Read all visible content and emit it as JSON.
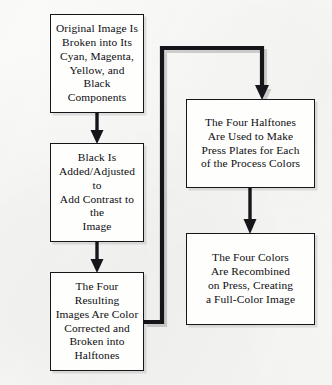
{
  "diagram": {
    "background_color": "#fdfdfc",
    "line_color": "#16161a",
    "text_color": "#0d0d10",
    "nodes": [
      {
        "id": "split",
        "label": "Original Image Is\nBroken into Its\nCyan, Magenta,\nYellow, and Black\nComponents",
        "column": "left",
        "order": 1
      },
      {
        "id": "black",
        "label": "Black Is\nAdded/Adjusted to\nAdd Contrast to the\nImage",
        "column": "left",
        "order": 2
      },
      {
        "id": "halftones",
        "label": "The Four Resulting\nImages Are Color\nCorrected and\nBroken into\nHalftones",
        "column": "left",
        "order": 3
      },
      {
        "id": "plates",
        "label": "The Four Halftones\nAre Used to Make\nPress Plates for Each\nof the Process Colors",
        "column": "right",
        "order": 4
      },
      {
        "id": "recombine",
        "label": "The Four Colors\nAre Recombined\non Press, Creating\na Full-Color Image",
        "column": "right",
        "order": 5
      }
    ],
    "edges": [
      {
        "id": "edge-split-black",
        "from": "split",
        "to": "black",
        "style": "straight-down",
        "arrow": true
      },
      {
        "id": "edge-black-halftones",
        "from": "black",
        "to": "halftones",
        "style": "straight-down",
        "arrow": true
      },
      {
        "id": "edge-halftones-plates",
        "from": "halftones",
        "to": "plates",
        "style": "right-up-right-down",
        "arrow": true
      },
      {
        "id": "edge-plates-recombine",
        "from": "plates",
        "to": "recombine",
        "style": "straight-down",
        "arrow": true
      }
    ]
  }
}
